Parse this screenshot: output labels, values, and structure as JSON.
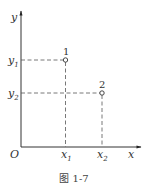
{
  "figure": {
    "caption": "图 1-7",
    "axes": {
      "x_label": "x",
      "y_label": "y",
      "origin_label": "O"
    },
    "ticks": {
      "x": [
        {
          "base": "x",
          "sub": "1"
        },
        {
          "base": "x",
          "sub": "2"
        }
      ],
      "y": [
        {
          "base": "y",
          "sub": "1"
        },
        {
          "base": "y",
          "sub": "2"
        }
      ]
    },
    "points": [
      {
        "label": "1",
        "x": "x1",
        "y": "y1"
      },
      {
        "label": "2",
        "x": "x2",
        "y": "y2"
      }
    ],
    "colors": {
      "line": "#333333",
      "dash": "#555555",
      "background": "#ffffff"
    }
  }
}
